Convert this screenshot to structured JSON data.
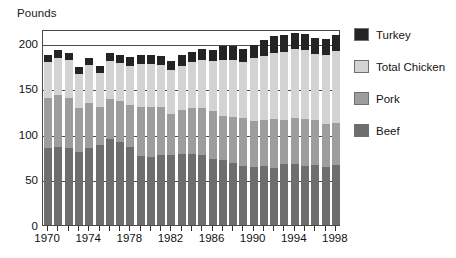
{
  "chart_data": {
    "type": "bar",
    "subtype": "stacked-bar",
    "title": "",
    "ylabel": "Pounds",
    "xlabel": "",
    "ylim": [
      0,
      215
    ],
    "yticks": [
      0,
      50,
      100,
      150,
      200
    ],
    "grid": true,
    "legend_position": "right",
    "categories": [
      "1970",
      "1971",
      "1972",
      "1973",
      "1974",
      "1975",
      "1976",
      "1977",
      "1978",
      "1979",
      "1980",
      "1981",
      "1982",
      "1983",
      "1984",
      "1985",
      "1986",
      "1987",
      "1988",
      "1989",
      "1990",
      "1991",
      "1992",
      "1993",
      "1994",
      "1995",
      "1996",
      "1997",
      "1998"
    ],
    "xtick_labels": [
      "1970",
      "1974",
      "1978",
      "1982",
      "1986",
      "1990",
      "1994",
      "1998"
    ],
    "series": [
      {
        "name": "Beef",
        "color": "#6e6e6e",
        "values": [
          84,
          86,
          84,
          80,
          85,
          88,
          94,
          91,
          86,
          76,
          75,
          77,
          77,
          78,
          78,
          77,
          72,
          71,
          68,
          65,
          64,
          65,
          63,
          67,
          67,
          65,
          66,
          64,
          66
        ]
      },
      {
        "name": "Pork",
        "color": "#9d9d9d",
        "values": [
          55,
          57,
          55,
          48,
          49,
          42,
          44,
          45,
          46,
          53,
          54,
          53,
          45,
          48,
          50,
          51,
          53,
          49,
          51,
          52,
          50,
          50,
          53,
          48,
          50,
          51,
          49,
          47,
          46
        ]
      },
      {
        "name": "Total Chicken",
        "color": "#d3d3d3",
        "values": [
          40,
          40,
          42,
          38,
          42,
          37,
          42,
          42,
          43,
          48,
          48,
          45,
          48,
          49,
          51,
          53,
          55,
          61,
          62,
          62,
          69,
          70,
          73,
          75,
          76,
          76,
          73,
          75,
          79
        ]
      },
      {
        "name": "Turkey",
        "color": "#242424",
        "values": [
          8,
          9,
          8,
          7,
          7,
          7,
          9,
          8,
          9,
          9,
          10,
          10,
          10,
          11,
          11,
          12,
          12,
          15,
          15,
          14,
          14,
          18,
          18,
          18,
          18,
          18,
          17,
          18,
          18
        ]
      }
    ]
  },
  "legend": {
    "items": [
      {
        "label": "Turkey",
        "color": "#242424"
      },
      {
        "label": "Total Chicken",
        "color": "#d3d3d3"
      },
      {
        "label": "Pork",
        "color": "#9d9d9d"
      },
      {
        "label": "Beef",
        "color": "#6e6e6e"
      }
    ]
  },
  "axis": {
    "y_title": "Pounds"
  }
}
